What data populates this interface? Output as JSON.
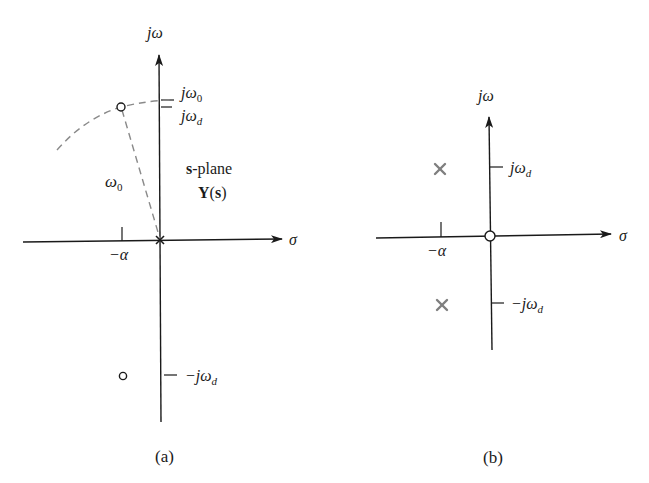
{
  "panel_a": {
    "caption": "(a)",
    "y_axis_label": "jω",
    "x_axis_label": "σ",
    "tick_labels": {
      "j_omega_0": "jω",
      "j_omega_0_sub": "0",
      "j_omega_d": "jω",
      "j_omega_d_sub": "d",
      "neg_j_omega_d": "−jω",
      "neg_j_omega_d_sub": "d",
      "neg_alpha": "−α"
    },
    "radius_label": "ω",
    "radius_label_sub": "0",
    "plane_label_bold": "s",
    "plane_label_rest": "-plane",
    "function_label_Y": "Y",
    "function_label_s": "s",
    "markers": {
      "zeros": [
        "upper-left (−α, jω_d)",
        "lower-left (−α, −jω_d)"
      ],
      "poles": [
        "origin"
      ]
    }
  },
  "panel_b": {
    "caption": "(b)",
    "y_axis_label": "jω",
    "x_axis_label": "σ",
    "tick_labels": {
      "j_omega_d": "jω",
      "j_omega_d_sub": "d",
      "neg_j_omega_d": "−jω",
      "neg_j_omega_d_sub": "d",
      "neg_alpha": "−α"
    },
    "markers": {
      "poles": [
        "(−α, jω_d)",
        "(−α, −jω_d)"
      ],
      "zeros": [
        "origin"
      ]
    }
  },
  "colors": {
    "ink": "#1a1a1a",
    "dashed": "#8a8a8a",
    "pole_marker": "#7f7f7f",
    "background": "#ffffff"
  }
}
